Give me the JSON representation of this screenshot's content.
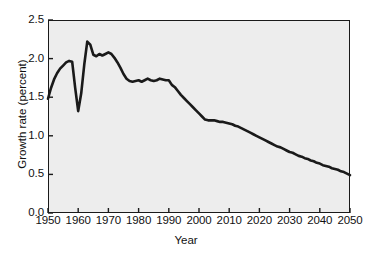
{
  "chart_data": {
    "type": "line",
    "title": "",
    "subtitle": "",
    "xlabel": "Year",
    "ylabel": "Growth rate (percent)",
    "xlim": [
      1950,
      2050
    ],
    "ylim": [
      0.0,
      2.5
    ],
    "xticks": [
      1950,
      1960,
      1970,
      1980,
      1990,
      2000,
      2010,
      2020,
      2030,
      2040,
      2050
    ],
    "xtick_labels": [
      "1950",
      "1960",
      "1970",
      "1980",
      "1990",
      "2000",
      "2010",
      "2020",
      "2030",
      "2040",
      "2050"
    ],
    "yticks": [
      0.0,
      0.5,
      1.0,
      1.5,
      2.0,
      2.5
    ],
    "ytick_labels": [
      "0.0",
      "0.5",
      "1.0",
      "1.5",
      "2.0",
      "2.5"
    ],
    "grid": false,
    "legend": null,
    "annotations": [],
    "line_color": "#1a1a1a",
    "line_width": 2.6,
    "plot_background": "#ededed",
    "figure_background": "#ffffff",
    "axis_color": "#1a1a1a",
    "series": [
      {
        "name": "World population growth rate",
        "x": [
          1950,
          1951,
          1952,
          1953,
          1954,
          1955,
          1956,
          1957,
          1958,
          1959,
          1960,
          1961,
          1962,
          1963,
          1964,
          1965,
          1966,
          1967,
          1968,
          1969,
          1970,
          1971,
          1972,
          1973,
          1974,
          1975,
          1976,
          1977,
          1978,
          1979,
          1980,
          1981,
          1982,
          1983,
          1984,
          1985,
          1986,
          1987,
          1988,
          1989,
          1990,
          1991,
          1992,
          1993,
          1994,
          1995,
          1996,
          1997,
          1998,
          1999,
          2000,
          2001,
          2002,
          2003,
          2004,
          2005,
          2006,
          2007,
          2008,
          2009,
          2010,
          2011,
          2012,
          2013,
          2014,
          2015,
          2016,
          2017,
          2018,
          2019,
          2020,
          2021,
          2022,
          2023,
          2024,
          2025,
          2026,
          2027,
          2028,
          2029,
          2030,
          2031,
          2032,
          2033,
          2034,
          2035,
          2036,
          2037,
          2038,
          2039,
          2040,
          2041,
          2042,
          2043,
          2044,
          2045,
          2046,
          2047,
          2048,
          2049,
          2050
        ],
        "y": [
          1.48,
          1.62,
          1.73,
          1.81,
          1.87,
          1.91,
          1.95,
          1.97,
          1.96,
          1.62,
          1.32,
          1.55,
          1.92,
          2.22,
          2.18,
          2.05,
          2.03,
          2.06,
          2.04,
          2.06,
          2.08,
          2.06,
          2.01,
          1.95,
          1.88,
          1.8,
          1.74,
          1.71,
          1.7,
          1.71,
          1.72,
          1.7,
          1.72,
          1.74,
          1.72,
          1.71,
          1.72,
          1.74,
          1.73,
          1.72,
          1.72,
          1.66,
          1.63,
          1.58,
          1.53,
          1.49,
          1.45,
          1.41,
          1.37,
          1.33,
          1.29,
          1.25,
          1.21,
          1.2,
          1.2,
          1.2,
          1.19,
          1.18,
          1.18,
          1.17,
          1.16,
          1.15,
          1.13,
          1.12,
          1.1,
          1.08,
          1.06,
          1.04,
          1.02,
          1.0,
          0.98,
          0.96,
          0.94,
          0.92,
          0.9,
          0.88,
          0.86,
          0.85,
          0.83,
          0.81,
          0.79,
          0.78,
          0.76,
          0.74,
          0.73,
          0.71,
          0.7,
          0.68,
          0.67,
          0.65,
          0.64,
          0.62,
          0.61,
          0.6,
          0.58,
          0.57,
          0.56,
          0.54,
          0.53,
          0.51,
          0.49
        ]
      }
    ]
  }
}
